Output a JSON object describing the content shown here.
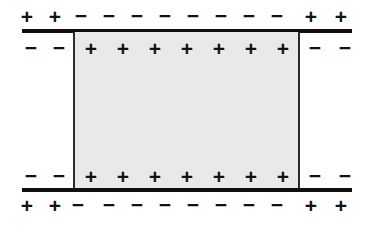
{
  "figure": {
    "colors": {
      "plate": "#100f0f",
      "slab_fill": "#e9e9e9",
      "slab_border": "#2a2a2a",
      "symbol": "#121212",
      "background": "#ffffff"
    },
    "symbols": {
      "plus": "+",
      "minus": "−"
    },
    "geometry": {
      "plate_left_x": 22,
      "plate_right_x": 352,
      "plate_top_y": 29,
      "plate_bottom_y": 188,
      "slab_left_x": 73,
      "slab_right_x": 300,
      "slab_top_y": 32,
      "slab_bottom_y": 190
    }
  },
  "rows": {
    "outer_top": {
      "label": "free-charge-row-above-top-plate",
      "charges": [
        {
          "sign": "+",
          "x": 27
        },
        {
          "sign": "+",
          "x": 55
        },
        {
          "sign": "−",
          "x": 81
        },
        {
          "sign": "−",
          "x": 109
        },
        {
          "sign": "−",
          "x": 137
        },
        {
          "sign": "−",
          "x": 165
        },
        {
          "sign": "−",
          "x": 193
        },
        {
          "sign": "−",
          "x": 221
        },
        {
          "sign": "−",
          "x": 249
        },
        {
          "sign": "−",
          "x": 277
        },
        {
          "sign": "+",
          "x": 311
        },
        {
          "sign": "+",
          "x": 341
        }
      ]
    },
    "inner_top": {
      "label": "charge-row-below-top-plate",
      "charges": [
        {
          "sign": "−",
          "x": 31
        },
        {
          "sign": "−",
          "x": 59
        },
        {
          "sign": "+",
          "x": 91
        },
        {
          "sign": "+",
          "x": 123
        },
        {
          "sign": "+",
          "x": 155
        },
        {
          "sign": "+",
          "x": 187
        },
        {
          "sign": "+",
          "x": 219
        },
        {
          "sign": "+",
          "x": 251
        },
        {
          "sign": "+",
          "x": 283
        },
        {
          "sign": "−",
          "x": 315
        },
        {
          "sign": "−",
          "x": 345
        }
      ]
    },
    "inner_bottom": {
      "label": "charge-row-above-bottom-plate",
      "charges": [
        {
          "sign": "−",
          "x": 31
        },
        {
          "sign": "−",
          "x": 59
        },
        {
          "sign": "+",
          "x": 91
        },
        {
          "sign": "+",
          "x": 123
        },
        {
          "sign": "+",
          "x": 155
        },
        {
          "sign": "+",
          "x": 187
        },
        {
          "sign": "+",
          "x": 219
        },
        {
          "sign": "+",
          "x": 251
        },
        {
          "sign": "+",
          "x": 283
        },
        {
          "sign": "−",
          "x": 315
        },
        {
          "sign": "−",
          "x": 345
        }
      ]
    },
    "outer_bottom": {
      "label": "free-charge-row-below-bottom-plate",
      "charges": [
        {
          "sign": "+",
          "x": 27
        },
        {
          "sign": "+",
          "x": 55
        },
        {
          "sign": "−",
          "x": 78
        },
        {
          "sign": "−",
          "x": 109
        },
        {
          "sign": "−",
          "x": 137
        },
        {
          "sign": "−",
          "x": 165
        },
        {
          "sign": "−",
          "x": 193
        },
        {
          "sign": "−",
          "x": 221
        },
        {
          "sign": "−",
          "x": 249
        },
        {
          "sign": "−",
          "x": 277
        },
        {
          "sign": "+",
          "x": 311
        },
        {
          "sign": "+",
          "x": 341
        }
      ]
    }
  }
}
